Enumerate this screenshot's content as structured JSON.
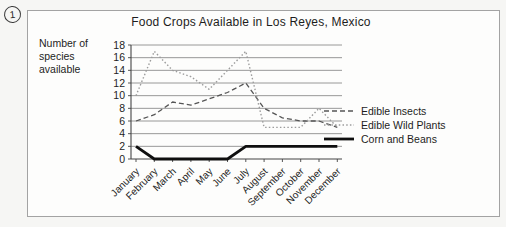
{
  "page": {
    "badge_number": "1"
  },
  "chart_data": {
    "type": "line",
    "title": "Food Crops Available in Los Reyes, Mexico",
    "ylabel_lines": [
      "Number of",
      "species",
      "available"
    ],
    "xlabel": "",
    "categories": [
      "January",
      "February",
      "March",
      "April",
      "May",
      "June",
      "July",
      "August",
      "September",
      "October",
      "November",
      "December"
    ],
    "y_ticks": [
      0,
      2,
      4,
      6,
      8,
      10,
      12,
      14,
      16,
      18
    ],
    "ylim": [
      0,
      18
    ],
    "grid": "horizontal",
    "legend_position": "right",
    "series": [
      {
        "name": "Edible Insects",
        "style": "dashed",
        "color": "#555555",
        "values": [
          6,
          7,
          9,
          8.5,
          9.5,
          10.5,
          12,
          8,
          6.5,
          6,
          6,
          5
        ]
      },
      {
        "name": "Edible Wild Plants",
        "style": "dotted",
        "color": "#9c9c9c",
        "values": [
          10,
          17,
          14,
          13,
          11,
          14,
          17,
          5,
          5,
          5,
          8,
          5
        ]
      },
      {
        "name": "Corn and Beans",
        "style": "solid",
        "color": "#0f0f0f",
        "values": [
          2,
          0,
          0,
          0,
          0,
          0,
          2,
          2,
          2,
          2,
          2,
          2
        ]
      }
    ],
    "axis_color": "#444444",
    "grid_color": "#7d7d7d",
    "tick_label_color": "#1d1d1d"
  }
}
